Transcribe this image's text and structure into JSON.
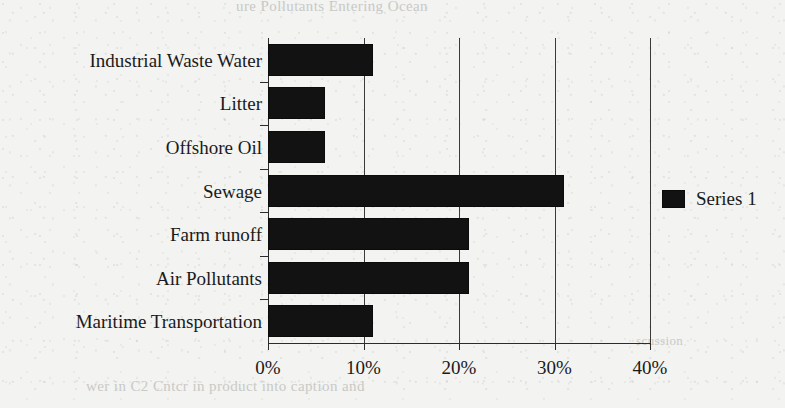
{
  "chart_data": {
    "type": "bar",
    "orientation": "horizontal",
    "title": "",
    "xlabel": "",
    "ylabel": "",
    "categories": [
      "Industrial Waste Water",
      "Litter",
      "Offshore Oil",
      "Sewage",
      "Farm runoff",
      "Air Pollutants",
      "Maritime Transportation"
    ],
    "series": [
      {
        "name": "Series 1",
        "color": "#121212",
        "values": [
          11,
          6,
          6,
          31,
          21,
          21,
          11
        ]
      }
    ],
    "values": [
      11,
      6,
      6,
      31,
      21,
      21,
      11
    ],
    "xlim": [
      0,
      40
    ],
    "xticks": [
      0,
      10,
      20,
      30,
      40
    ],
    "xtick_labels": [
      "0%",
      "10%",
      "20%",
      "30%",
      "40%"
    ],
    "grid": "vertical",
    "legend_position": "right"
  },
  "legend": {
    "entries": [
      {
        "label": "Series 1",
        "swatch_color": "#121212"
      }
    ]
  },
  "page_artifacts": {
    "ghost_text_top": "ure Pollutants Entering Ocean",
    "ghost_text_middle": "scussion",
    "ghost_text_bottom": "wer in C2 Cntcr in product into caption and"
  },
  "colors": {
    "background": "#f3f3f1",
    "bar": "#121212",
    "axis": "#2b2b2b",
    "grid": "#3a3a3a",
    "text": "#1a1a1a"
  }
}
